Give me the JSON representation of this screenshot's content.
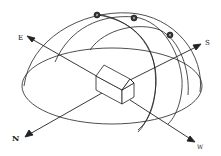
{
  "diagram": {
    "type": "sun-path-diagram",
    "compass": {
      "east": "E",
      "south": "S",
      "north": "N",
      "west": "W"
    },
    "sun_positions": [
      {
        "label": "sun-1"
      },
      {
        "label": "sun-2"
      },
      {
        "label": "sun-3"
      }
    ],
    "stroke_color": "#222222",
    "background": "#ffffff"
  }
}
